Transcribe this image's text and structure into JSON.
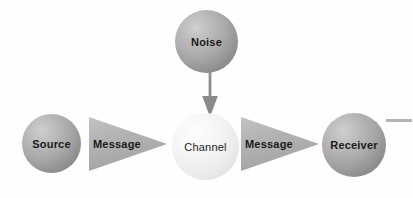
{
  "diagram": {
    "background_color": "#fefefe",
    "nodes": [
      {
        "id": "source",
        "label": "Source",
        "shape": "sphere",
        "fill": "#a9a9a9",
        "text_color": "#1a1a1a",
        "weight": "bold"
      },
      {
        "id": "noise",
        "label": "Noise",
        "shape": "sphere",
        "fill": "#a9a9a9",
        "text_color": "#1a1a1a",
        "weight": "bold"
      },
      {
        "id": "channel",
        "label": "Channel",
        "shape": "sphere",
        "fill": "#efeff0",
        "text_color": "#242424",
        "weight": "regular"
      },
      {
        "id": "receiver",
        "label": "Receiver",
        "shape": "sphere",
        "fill": "#a9a9a9",
        "text_color": "#1a1a1a",
        "weight": "bold"
      }
    ],
    "connectors": [
      {
        "id": "message-1",
        "label": "Message",
        "shape": "triangle-right",
        "from": "source",
        "to": "channel",
        "fill": "#b0b0b0"
      },
      {
        "id": "message-2",
        "label": "Message",
        "shape": "triangle-right",
        "from": "channel",
        "to": "receiver",
        "fill": "#b0b0b0"
      },
      {
        "id": "noise-arrow",
        "label": "",
        "shape": "arrow-down",
        "from": "noise",
        "to": "channel",
        "fill": "#8c8c8c"
      }
    ],
    "decorations": [
      {
        "id": "edge-rule",
        "shape": "horizontal-line",
        "color": "#b4b4b4"
      }
    ]
  }
}
